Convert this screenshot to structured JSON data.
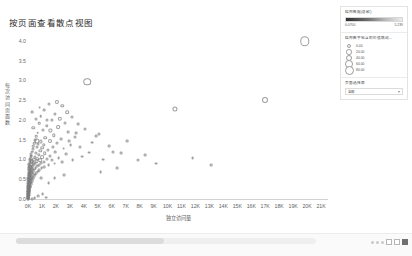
{
  "chart_data": {
    "type": "scatter",
    "title": "按页面查看散点视图",
    "xlabel": "独立访问量",
    "ylabel": "每次访问页面数",
    "xlim": [
      0,
      21500
    ],
    "ylim": [
      0,
      4.25
    ],
    "grid": false,
    "xticks": [
      "0K",
      "1K",
      "2K",
      "3K",
      "4K",
      "5K",
      "6K",
      "7K",
      "8K",
      "9K",
      "10K",
      "11K",
      "12K",
      "13K",
      "14K",
      "15K",
      "16K",
      "17K",
      "18K",
      "19K",
      "20K",
      "21K"
    ],
    "xtick_values": [
      0,
      1000,
      2000,
      3000,
      4000,
      5000,
      6000,
      7000,
      8000,
      9000,
      10000,
      11000,
      12000,
      13000,
      14000,
      15000,
      16000,
      17000,
      18000,
      19000,
      20000,
      21000
    ],
    "yticks": [
      "0.0",
      "0.5",
      "1.0",
      "1.5",
      "2.0",
      "2.5",
      "3.0",
      "3.5",
      "4.0"
    ],
    "ytick_values": [
      0.0,
      0.5,
      1.0,
      1.5,
      2.0,
      2.5,
      3.0,
      3.5,
      4.0
    ],
    "marker": "open-circle",
    "points": [
      {
        "x": 19850,
        "y": 4.02,
        "s": 9.5
      },
      {
        "x": 4250,
        "y": 2.99,
        "s": 7.5
      },
      {
        "x": 16950,
        "y": 2.52,
        "s": 6.0
      },
      {
        "x": 10550,
        "y": 2.3,
        "s": 5.2
      },
      {
        "x": 2050,
        "y": 2.48,
        "s": 4.2
      },
      {
        "x": 2450,
        "y": 2.38,
        "s": 3.4
      },
      {
        "x": 1500,
        "y": 2.42,
        "s": 3.0
      },
      {
        "x": 2800,
        "y": 2.22,
        "s": 3.6
      },
      {
        "x": 1950,
        "y": 2.18,
        "s": 3.2
      },
      {
        "x": 1150,
        "y": 2.28,
        "s": 2.8
      },
      {
        "x": 3150,
        "y": 2.1,
        "s": 3.0
      },
      {
        "x": 2300,
        "y": 2.05,
        "s": 4.4
      },
      {
        "x": 1700,
        "y": 2.02,
        "s": 3.2
      },
      {
        "x": 900,
        "y": 2.12,
        "s": 2.6
      },
      {
        "x": 2650,
        "y": 1.95,
        "s": 3.0
      },
      {
        "x": 3600,
        "y": 1.92,
        "s": 2.8
      },
      {
        "x": 1350,
        "y": 1.88,
        "s": 3.4
      },
      {
        "x": 2150,
        "y": 1.85,
        "s": 3.8
      },
      {
        "x": 800,
        "y": 1.95,
        "s": 2.6
      },
      {
        "x": 4050,
        "y": 1.8,
        "s": 3.0
      },
      {
        "x": 1600,
        "y": 1.76,
        "s": 3.2
      },
      {
        "x": 2900,
        "y": 1.72,
        "s": 2.8
      },
      {
        "x": 1050,
        "y": 1.78,
        "s": 3.0
      },
      {
        "x": 5100,
        "y": 1.68,
        "s": 3.2
      },
      {
        "x": 1850,
        "y": 1.64,
        "s": 3.4
      },
      {
        "x": 700,
        "y": 1.7,
        "s": 2.6
      },
      {
        "x": 3350,
        "y": 1.6,
        "s": 3.0
      },
      {
        "x": 1250,
        "y": 1.58,
        "s": 3.6
      },
      {
        "x": 2400,
        "y": 1.55,
        "s": 2.8
      },
      {
        "x": 600,
        "y": 1.62,
        "s": 2.6
      },
      {
        "x": 1550,
        "y": 1.5,
        "s": 4.0
      },
      {
        "x": 950,
        "y": 1.48,
        "s": 3.2
      },
      {
        "x": 4600,
        "y": 1.45,
        "s": 2.8
      },
      {
        "x": 2050,
        "y": 1.44,
        "s": 3.0
      },
      {
        "x": 500,
        "y": 1.52,
        "s": 2.8
      },
      {
        "x": 1150,
        "y": 1.4,
        "s": 3.4
      },
      {
        "x": 3050,
        "y": 1.38,
        "s": 2.8
      },
      {
        "x": 750,
        "y": 1.42,
        "s": 3.0
      },
      {
        "x": 1800,
        "y": 1.35,
        "s": 3.2
      },
      {
        "x": 430,
        "y": 1.44,
        "s": 2.6
      },
      {
        "x": 1000,
        "y": 1.32,
        "s": 3.6
      },
      {
        "x": 2550,
        "y": 1.3,
        "s": 2.8
      },
      {
        "x": 640,
        "y": 1.34,
        "s": 3.0
      },
      {
        "x": 1420,
        "y": 1.27,
        "s": 3.2
      },
      {
        "x": 380,
        "y": 1.36,
        "s": 2.6
      },
      {
        "x": 880,
        "y": 1.24,
        "s": 3.4
      },
      {
        "x": 6100,
        "y": 1.22,
        "s": 3.0
      },
      {
        "x": 1950,
        "y": 1.21,
        "s": 2.8
      },
      {
        "x": 330,
        "y": 1.28,
        "s": 3.0
      },
      {
        "x": 560,
        "y": 1.2,
        "s": 3.2
      },
      {
        "x": 1200,
        "y": 1.18,
        "s": 3.6
      },
      {
        "x": 2750,
        "y": 1.16,
        "s": 2.8
      },
      {
        "x": 290,
        "y": 1.22,
        "s": 2.6
      },
      {
        "x": 780,
        "y": 1.14,
        "s": 3.4
      },
      {
        "x": 1600,
        "y": 1.12,
        "s": 3.0
      },
      {
        "x": 3900,
        "y": 1.1,
        "s": 2.8
      },
      {
        "x": 250,
        "y": 1.16,
        "s": 3.0
      },
      {
        "x": 480,
        "y": 1.1,
        "s": 3.2
      },
      {
        "x": 1020,
        "y": 1.08,
        "s": 3.8
      },
      {
        "x": 2200,
        "y": 1.06,
        "s": 2.8
      },
      {
        "x": 215,
        "y": 1.12,
        "s": 2.6
      },
      {
        "x": 660,
        "y": 1.04,
        "s": 3.4
      },
      {
        "x": 1380,
        "y": 1.03,
        "s": 3.0
      },
      {
        "x": 5400,
        "y": 1.02,
        "s": 2.8
      },
      {
        "x": 185,
        "y": 1.08,
        "s": 3.2
      },
      {
        "x": 400,
        "y": 1.02,
        "s": 4.4
      },
      {
        "x": 870,
        "y": 1.01,
        "s": 3.6
      },
      {
        "x": 1750,
        "y": 1.0,
        "s": 3.0
      },
      {
        "x": 3200,
        "y": 1.0,
        "s": 2.8
      },
      {
        "x": 7900,
        "y": 1.0,
        "s": 3.0
      },
      {
        "x": 160,
        "y": 1.04,
        "s": 2.8
      },
      {
        "x": 320,
        "y": 0.99,
        "s": 4.0
      },
      {
        "x": 620,
        "y": 0.98,
        "s": 3.4
      },
      {
        "x": 1150,
        "y": 0.97,
        "s": 3.0
      },
      {
        "x": 2450,
        "y": 0.96,
        "s": 2.8
      },
      {
        "x": 140,
        "y": 1.0,
        "s": 3.0
      },
      {
        "x": 265,
        "y": 0.95,
        "s": 3.8
      },
      {
        "x": 510,
        "y": 0.94,
        "s": 3.2
      },
      {
        "x": 940,
        "y": 0.93,
        "s": 3.0
      },
      {
        "x": 1900,
        "y": 0.92,
        "s": 2.8
      },
      {
        "x": 120,
        "y": 0.96,
        "s": 3.2
      },
      {
        "x": 225,
        "y": 0.91,
        "s": 3.6
      },
      {
        "x": 420,
        "y": 0.9,
        "s": 3.0
      },
      {
        "x": 760,
        "y": 0.89,
        "s": 3.0
      },
      {
        "x": 1480,
        "y": 0.88,
        "s": 2.8
      },
      {
        "x": 105,
        "y": 0.92,
        "s": 3.0
      },
      {
        "x": 195,
        "y": 0.87,
        "s": 3.4
      },
      {
        "x": 350,
        "y": 0.86,
        "s": 3.2
      },
      {
        "x": 640,
        "y": 0.85,
        "s": 2.8
      },
      {
        "x": 1180,
        "y": 0.84,
        "s": 2.8
      },
      {
        "x": 92,
        "y": 0.88,
        "s": 3.0
      },
      {
        "x": 170,
        "y": 0.83,
        "s": 3.2
      },
      {
        "x": 295,
        "y": 0.82,
        "s": 3.0
      },
      {
        "x": 540,
        "y": 0.81,
        "s": 2.8
      },
      {
        "x": 980,
        "y": 0.8,
        "s": 2.8
      },
      {
        "x": 80,
        "y": 0.84,
        "s": 3.0
      },
      {
        "x": 150,
        "y": 0.79,
        "s": 3.4
      },
      {
        "x": 255,
        "y": 0.78,
        "s": 3.0
      },
      {
        "x": 455,
        "y": 0.77,
        "s": 2.8
      },
      {
        "x": 820,
        "y": 0.76,
        "s": 2.8
      },
      {
        "x": 70,
        "y": 0.8,
        "s": 3.2
      },
      {
        "x": 132,
        "y": 0.75,
        "s": 3.0
      },
      {
        "x": 220,
        "y": 0.74,
        "s": 3.2
      },
      {
        "x": 390,
        "y": 0.73,
        "s": 2.8
      },
      {
        "x": 700,
        "y": 0.72,
        "s": 2.8
      },
      {
        "x": 62,
        "y": 0.76,
        "s": 3.0
      },
      {
        "x": 118,
        "y": 0.71,
        "s": 3.0
      },
      {
        "x": 192,
        "y": 0.7,
        "s": 3.0
      },
      {
        "x": 335,
        "y": 0.69,
        "s": 2.8
      },
      {
        "x": 600,
        "y": 0.68,
        "s": 2.8
      },
      {
        "x": 55,
        "y": 0.72,
        "s": 3.2
      },
      {
        "x": 104,
        "y": 0.67,
        "s": 3.0
      },
      {
        "x": 168,
        "y": 0.66,
        "s": 3.0
      },
      {
        "x": 288,
        "y": 0.65,
        "s": 2.8
      },
      {
        "x": 515,
        "y": 0.64,
        "s": 2.8
      },
      {
        "x": 48,
        "y": 0.68,
        "s": 3.0
      },
      {
        "x": 92,
        "y": 0.63,
        "s": 3.2
      },
      {
        "x": 147,
        "y": 0.62,
        "s": 3.0
      },
      {
        "x": 248,
        "y": 0.61,
        "s": 2.8
      },
      {
        "x": 440,
        "y": 0.6,
        "s": 2.8
      },
      {
        "x": 42,
        "y": 0.64,
        "s": 3.0
      },
      {
        "x": 81,
        "y": 0.59,
        "s": 3.0
      },
      {
        "x": 128,
        "y": 0.58,
        "s": 3.0
      },
      {
        "x": 214,
        "y": 0.57,
        "s": 2.8
      },
      {
        "x": 378,
        "y": 0.56,
        "s": 2.8
      },
      {
        "x": 930,
        "y": 0.55,
        "s": 2.8
      },
      {
        "x": 37,
        "y": 0.6,
        "s": 3.0
      },
      {
        "x": 71,
        "y": 0.55,
        "s": 3.0
      },
      {
        "x": 112,
        "y": 0.54,
        "s": 3.0
      },
      {
        "x": 184,
        "y": 0.53,
        "s": 2.8
      },
      {
        "x": 322,
        "y": 0.52,
        "s": 2.8
      },
      {
        "x": 32,
        "y": 0.56,
        "s": 3.0
      },
      {
        "x": 62,
        "y": 0.51,
        "s": 3.0
      },
      {
        "x": 97,
        "y": 0.5,
        "s": 3.0
      },
      {
        "x": 158,
        "y": 0.49,
        "s": 2.8
      },
      {
        "x": 274,
        "y": 0.48,
        "s": 2.8
      },
      {
        "x": 28,
        "y": 0.52,
        "s": 3.0
      },
      {
        "x": 54,
        "y": 0.47,
        "s": 3.0
      },
      {
        "x": 84,
        "y": 0.46,
        "s": 3.0
      },
      {
        "x": 136,
        "y": 0.45,
        "s": 2.8
      },
      {
        "x": 232,
        "y": 0.44,
        "s": 2.8
      },
      {
        "x": 24,
        "y": 0.48,
        "s": 3.0
      },
      {
        "x": 47,
        "y": 0.43,
        "s": 3.0
      },
      {
        "x": 73,
        "y": 0.42,
        "s": 3.0
      },
      {
        "x": 117,
        "y": 0.41,
        "s": 2.8
      },
      {
        "x": 197,
        "y": 0.4,
        "s": 2.8
      },
      {
        "x": 21,
        "y": 0.44,
        "s": 3.0
      },
      {
        "x": 41,
        "y": 0.39,
        "s": 3.0
      },
      {
        "x": 63,
        "y": 0.38,
        "s": 3.0
      },
      {
        "x": 100,
        "y": 0.37,
        "s": 2.8
      },
      {
        "x": 167,
        "y": 0.36,
        "s": 2.8
      },
      {
        "x": 18,
        "y": 0.4,
        "s": 3.0
      },
      {
        "x": 35,
        "y": 0.35,
        "s": 3.0
      },
      {
        "x": 54,
        "y": 0.34,
        "s": 3.0
      },
      {
        "x": 85,
        "y": 0.33,
        "s": 2.8
      },
      {
        "x": 141,
        "y": 0.32,
        "s": 2.8
      },
      {
        "x": 16,
        "y": 0.36,
        "s": 3.0
      },
      {
        "x": 30,
        "y": 0.31,
        "s": 3.0
      },
      {
        "x": 46,
        "y": 0.3,
        "s": 3.0
      },
      {
        "x": 72,
        "y": 0.29,
        "s": 2.8
      },
      {
        "x": 119,
        "y": 0.28,
        "s": 2.8
      },
      {
        "x": 14,
        "y": 0.32,
        "s": 3.0
      },
      {
        "x": 26,
        "y": 0.27,
        "s": 3.0
      },
      {
        "x": 39,
        "y": 0.26,
        "s": 3.0
      },
      {
        "x": 61,
        "y": 0.25,
        "s": 2.8
      },
      {
        "x": 100,
        "y": 0.24,
        "s": 2.8
      },
      {
        "x": 12,
        "y": 0.28,
        "s": 3.0
      },
      {
        "x": 22,
        "y": 0.23,
        "s": 3.0
      },
      {
        "x": 33,
        "y": 0.22,
        "s": 3.0
      },
      {
        "x": 52,
        "y": 0.21,
        "s": 2.8
      },
      {
        "x": 84,
        "y": 0.2,
        "s": 2.8
      },
      {
        "x": 10,
        "y": 0.24,
        "s": 3.0
      },
      {
        "x": 19,
        "y": 0.19,
        "s": 3.0
      },
      {
        "x": 28,
        "y": 0.18,
        "s": 3.0
      },
      {
        "x": 44,
        "y": 0.17,
        "s": 2.8
      },
      {
        "x": 71,
        "y": 0.16,
        "s": 2.8
      },
      {
        "x": 9,
        "y": 0.2,
        "s": 3.0
      },
      {
        "x": 16,
        "y": 0.15,
        "s": 3.0
      },
      {
        "x": 24,
        "y": 0.14,
        "s": 3.0
      },
      {
        "x": 37,
        "y": 0.13,
        "s": 2.8
      },
      {
        "x": 60,
        "y": 0.12,
        "s": 2.8
      },
      {
        "x": 8,
        "y": 0.16,
        "s": 3.0
      },
      {
        "x": 14,
        "y": 0.11,
        "s": 3.0
      },
      {
        "x": 20,
        "y": 0.1,
        "s": 3.0
      },
      {
        "x": 31,
        "y": 0.09,
        "s": 2.8
      },
      {
        "x": 50,
        "y": 0.08,
        "s": 2.8
      },
      {
        "x": 7,
        "y": 0.12,
        "s": 3.0
      },
      {
        "x": 12,
        "y": 0.07,
        "s": 3.0
      },
      {
        "x": 17,
        "y": 0.06,
        "s": 3.0
      },
      {
        "x": 26,
        "y": 0.05,
        "s": 2.8
      },
      {
        "x": 42,
        "y": 0.04,
        "s": 2.8
      },
      {
        "x": 6,
        "y": 0.08,
        "s": 3.0
      },
      {
        "x": 10,
        "y": 0.03,
        "s": 3.0
      },
      {
        "x": 15,
        "y": 0.02,
        "s": 3.0
      },
      {
        "x": 310,
        "y": 0.03,
        "s": 2.8
      },
      {
        "x": 480,
        "y": 0.05,
        "s": 2.8
      },
      {
        "x": 720,
        "y": 0.1,
        "s": 2.8
      },
      {
        "x": 1320,
        "y": 0.06,
        "s": 2.8
      },
      {
        "x": 1050,
        "y": 0.14,
        "s": 2.8
      },
      {
        "x": 640,
        "y": 1.5,
        "s": 5.0
      },
      {
        "x": 370,
        "y": 1.82,
        "s": 3.4
      },
      {
        "x": 540,
        "y": 2.05,
        "s": 3.0
      },
      {
        "x": 280,
        "y": 2.22,
        "s": 2.8
      },
      {
        "x": 830,
        "y": 2.34,
        "s": 2.8
      },
      {
        "x": 1380,
        "y": 2.02,
        "s": 3.0
      },
      {
        "x": 3750,
        "y": 1.34,
        "s": 3.0
      },
      {
        "x": 4400,
        "y": 1.2,
        "s": 2.8
      },
      {
        "x": 6700,
        "y": 1.18,
        "s": 2.8
      },
      {
        "x": 8400,
        "y": 1.14,
        "s": 2.8
      },
      {
        "x": 9200,
        "y": 0.92,
        "s": 2.8
      },
      {
        "x": 11800,
        "y": 1.05,
        "s": 2.8
      },
      {
        "x": 13100,
        "y": 0.88,
        "s": 2.8
      },
      {
        "x": 7100,
        "y": 1.48,
        "s": 2.8
      },
      {
        "x": 5800,
        "y": 1.36,
        "s": 2.8
      },
      {
        "x": 4900,
        "y": 1.62,
        "s": 2.8
      },
      {
        "x": 3450,
        "y": 1.7,
        "s": 2.8
      },
      {
        "x": 2950,
        "y": 1.48,
        "s": 2.8
      },
      {
        "x": 6400,
        "y": 0.8,
        "s": 2.8
      },
      {
        "x": 5200,
        "y": 0.7,
        "s": 2.8
      },
      {
        "x": 2600,
        "y": 0.62,
        "s": 2.8
      },
      {
        "x": 1900,
        "y": 0.55,
        "s": 2.8
      },
      {
        "x": 1480,
        "y": 0.42,
        "s": 2.8
      }
    ]
  },
  "panel": {
    "color_legend": {
      "title": "结构数据(总和)",
      "min": "0.0700",
      "max": "5.239"
    },
    "size_legend": {
      "title": "结构数字包含的价值跳动...",
      "items": [
        {
          "value": "0.00",
          "radius": 1.0
        },
        {
          "value": "20.00",
          "radius": 1.7
        },
        {
          "value": "40.00",
          "radius": 2.3
        },
        {
          "value": "60.00",
          "radius": 2.9
        },
        {
          "value": "80.00",
          "radius": 3.5
        }
      ]
    },
    "selector": {
      "title": "页面选择器",
      "value": "全部"
    }
  },
  "bottom_bar": {
    "scroll_label": "horizontal-scrollbar",
    "icons": [
      "dot",
      "dot",
      "dot",
      "box",
      "box",
      "box-filled"
    ]
  }
}
